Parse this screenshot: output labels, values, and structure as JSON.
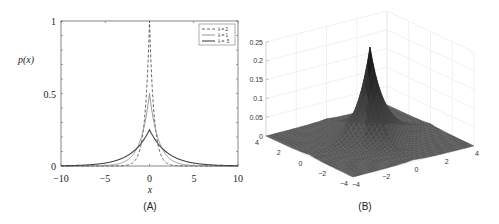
{
  "figure": {
    "panels": [
      "(A)",
      "(B)"
    ]
  },
  "chart_data": [
    {
      "type": "line",
      "panel_label": "(A)",
      "title": "",
      "xlabel": "x",
      "ylabel": "p(x)",
      "xlim": [
        -10,
        10
      ],
      "ylim": [
        0,
        1
      ],
      "xticks": [
        -10,
        -5,
        0,
        5,
        10
      ],
      "xtick_labels": [
        "−10",
        "−5",
        "0",
        "5",
        "10"
      ],
      "yticks": [
        0,
        0.5,
        1
      ],
      "ytick_labels": [
        "0",
        "0.5",
        "1"
      ],
      "yminor_step": 0.1,
      "grid": false,
      "legend_position": "upper right",
      "function": "p(x) = (λ/2)·exp(−λ|x|)",
      "series": [
        {
          "name": "λ = 2",
          "lambda": 2,
          "style": "dashed",
          "color": "#555555",
          "width": 0.9,
          "peak": 1.0
        },
        {
          "name": "λ = 1",
          "lambda": 1,
          "style": "solid",
          "color": "#8a8a8a",
          "width": 0.9,
          "peak": 0.5
        },
        {
          "name": "λ = .5",
          "lambda": 0.5,
          "style": "solid",
          "color": "#444444",
          "width": 1.1,
          "peak": 0.25
        }
      ]
    },
    {
      "type": "surface",
      "panel_label": "(B)",
      "title": "",
      "function": "p(x,y) = (1/4)·exp(−|x| − |y|)",
      "xlim": [
        -4,
        4
      ],
      "ylim": [
        -4,
        4
      ],
      "zlim": [
        0,
        0.25
      ],
      "zticks": [
        0,
        0.05,
        0.1,
        0.15,
        0.2,
        0.25
      ],
      "ztick_labels": [
        "0",
        "0.05",
        "0.1",
        "0.15",
        "0.2",
        "0.25"
      ],
      "left_axis_ticks": [
        "4",
        "2",
        "0",
        "−2",
        "−4"
      ],
      "right_axis_ticks": [
        "−4",
        "−2",
        "0",
        "2",
        "4"
      ],
      "peak_value": 0.25,
      "grid": true,
      "surface_color": "#555555"
    }
  ]
}
